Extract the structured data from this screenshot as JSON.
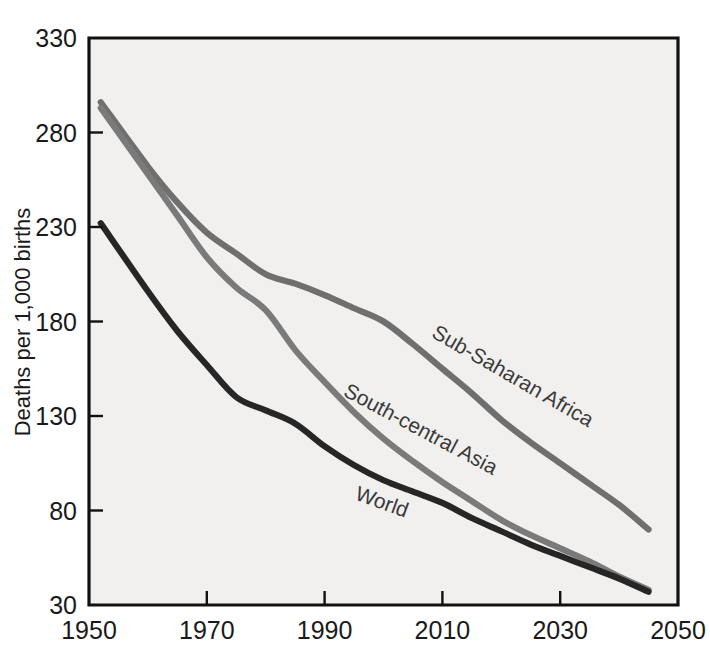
{
  "chart_data": {
    "type": "line",
    "title": "",
    "subtitle": "",
    "xlabel": "",
    "ylabel": "Deaths per 1,000 births",
    "xlim": [
      1950,
      2050
    ],
    "ylim": [
      30,
      330
    ],
    "grid": false,
    "legend_position": "inline-on-lines",
    "y_ticks": [
      330,
      280,
      230,
      180,
      130,
      80,
      30
    ],
    "y_tick_labels": [
      "330",
      "280",
      "230",
      "180",
      "130",
      "80",
      "30"
    ],
    "x_ticks": [
      1950,
      1970,
      1990,
      2010,
      2030,
      2050
    ],
    "x_tick_labels": [
      "1950",
      "1970",
      "1990",
      "2010",
      "2030",
      "2050"
    ],
    "x": [
      1952,
      1960,
      1965,
      1970,
      1975,
      1980,
      1985,
      1990,
      1995,
      2000,
      2005,
      2010,
      2015,
      2020,
      2025,
      2030,
      2035,
      2040,
      2045
    ],
    "series": [
      {
        "name": "Sub-Saharan Africa",
        "color": "#6f6f6f",
        "label_color": "#4a4a4a",
        "values": [
          296,
          262,
          243,
          227,
          216,
          205,
          200,
          194,
          187,
          180,
          168,
          155,
          142,
          128,
          116,
          105,
          94,
          83,
          70
        ],
        "label_x": 2008,
        "label_y": 172,
        "label_rotation": 30
      },
      {
        "name": "South-central Asia",
        "color": "#7a7a7a",
        "label_color": "#4a4a4a",
        "values": [
          293,
          258,
          236,
          214,
          198,
          186,
          165,
          148,
          132,
          118,
          106,
          95,
          85,
          75,
          67,
          60,
          53,
          45,
          38
        ],
        "label_x": 1993,
        "label_y": 141,
        "label_rotation": 28
      },
      {
        "name": "World",
        "color": "#262626",
        "label_color": "#2b2b2b",
        "values": [
          232,
          196,
          175,
          157,
          140,
          133,
          126,
          114,
          104,
          96,
          90,
          84,
          76,
          69,
          62,
          56,
          50,
          44,
          37
        ],
        "label_x": 1995,
        "label_y": 86,
        "label_rotation": 20
      }
    ]
  },
  "figure": {
    "plot_background_color": "#f1f0ee",
    "page_background_color": "#ffffff",
    "axis_color": "#111111"
  }
}
